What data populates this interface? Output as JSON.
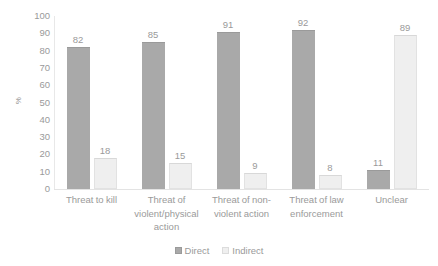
{
  "chart_data": {
    "type": "bar",
    "title": "",
    "subtitle": "",
    "xlabel": "",
    "ylabel": "%",
    "ylim": [
      0,
      100
    ],
    "ytick_step": 10,
    "yticks": [
      100,
      90,
      80,
      70,
      60,
      50,
      40,
      30,
      20,
      10,
      0
    ],
    "grid": false,
    "legend_position": "bottom-center",
    "categories": [
      "Threat to kill",
      "Threat of violent/physical action",
      "Threat of non-violent action",
      "Threat of law enforcement",
      "Unclear"
    ],
    "series": [
      {
        "name": "Direct",
        "color": "#a9a9a9",
        "values": [
          82,
          85,
          91,
          92,
          11
        ]
      },
      {
        "name": "Indirect",
        "color": "#efefef",
        "values": [
          18,
          15,
          9,
          8,
          89
        ]
      }
    ],
    "data_labels": true
  },
  "axis": {
    "y_title": "%"
  },
  "legend": {
    "items": [
      {
        "label": "Direct",
        "swatch": "legend-swatch-direct"
      },
      {
        "label": "Indirect",
        "swatch": "legend-swatch-indirect"
      }
    ]
  }
}
